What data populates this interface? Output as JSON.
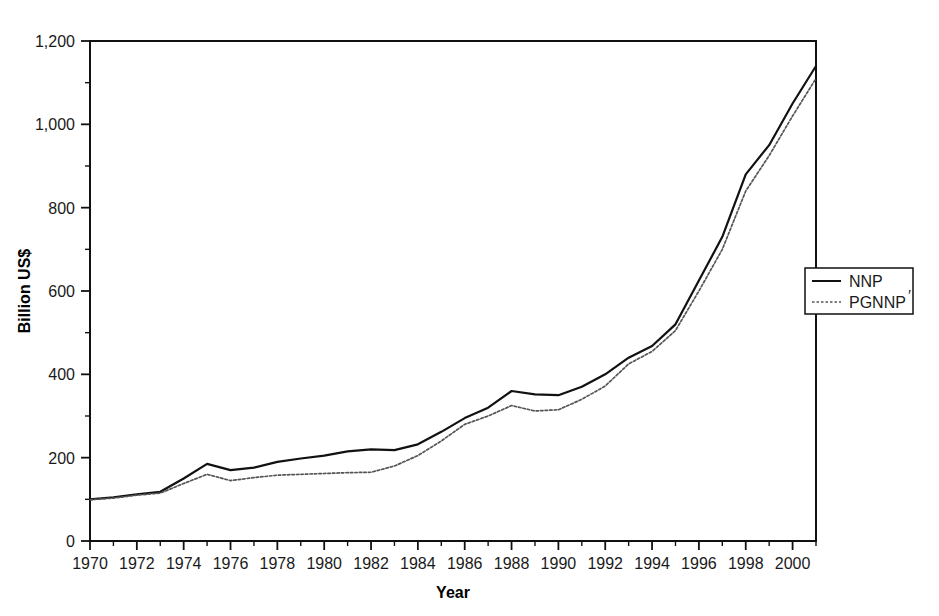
{
  "chart_data": {
    "type": "line",
    "title": "",
    "xlabel": "Year",
    "ylabel": "Billion US$",
    "xlim": [
      1970,
      2001
    ],
    "ylim": [
      0,
      1200
    ],
    "grid": false,
    "legend_position": "right-middle",
    "x": [
      1970,
      1971,
      1972,
      1973,
      1974,
      1975,
      1976,
      1977,
      1978,
      1979,
      1980,
      1981,
      1982,
      1983,
      1984,
      1985,
      1986,
      1987,
      1988,
      1989,
      1990,
      1991,
      1992,
      1993,
      1994,
      1995,
      1996,
      1997,
      1998,
      1999,
      2000,
      2001
    ],
    "series": [
      {
        "name": "NNP",
        "style": "solid",
        "color": "#111111",
        "values": [
          100,
          105,
          112,
          118,
          150,
          185,
          170,
          176,
          190,
          198,
          205,
          215,
          220,
          218,
          232,
          262,
          295,
          320,
          360,
          352,
          350,
          370,
          400,
          440,
          468,
          520,
          625,
          730,
          880,
          950,
          1050,
          1140
        ]
      },
      {
        "name": "PGNNP'",
        "style": "dashed",
        "color": "#555555",
        "values": [
          99,
          103,
          110,
          115,
          138,
          160,
          145,
          152,
          158,
          160,
          162,
          164,
          165,
          180,
          205,
          240,
          280,
          300,
          325,
          312,
          315,
          340,
          372,
          425,
          455,
          505,
          600,
          700,
          840,
          925,
          1020,
          1110
        ]
      }
    ],
    "x_tick_values": [
      1970,
      1972,
      1974,
      1976,
      1978,
      1980,
      1982,
      1984,
      1986,
      1988,
      1990,
      1992,
      1994,
      1996,
      1998,
      2000
    ],
    "x_tick_labels": [
      "1970",
      "1972",
      "1974",
      "1976",
      "1978",
      "1980",
      "1982",
      "1984",
      "1986",
      "1988",
      "1990",
      "1992",
      "1994",
      "1996",
      "1998",
      "2000"
    ],
    "x_minor_step": 1,
    "y_tick_values": [
      0,
      200,
      400,
      600,
      800,
      1000,
      1200
    ],
    "y_tick_labels": [
      "0",
      "200",
      "400",
      "600",
      "800",
      "1,000",
      "1,200"
    ],
    "y_minor_step": 100
  },
  "legend": {
    "entries": [
      {
        "label": "NNP",
        "prime": ""
      },
      {
        "label": "PGNNP",
        "prime": "′"
      }
    ]
  },
  "axes": {
    "x_title": "Year",
    "y_title": "Billion US$"
  }
}
